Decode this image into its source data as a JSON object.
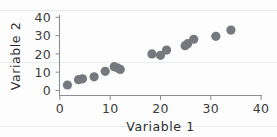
{
  "chart_data": {
    "type": "scatter",
    "title": "",
    "xlabel": "Variable 1",
    "ylabel": "Variable 2",
    "xlim": [
      0,
      40
    ],
    "ylim": [
      0,
      40
    ],
    "xticks": [
      0,
      10,
      20,
      30,
      40
    ],
    "yticks": [
      0,
      10,
      20,
      30,
      40
    ],
    "xtick_labels": [
      "0",
      "10",
      "20",
      "30",
      "40"
    ],
    "ytick_labels": [
      "0",
      "10",
      "20",
      "30",
      "40"
    ],
    "grid": false,
    "legend": null,
    "marker": {
      "shape": "circle",
      "color": "#75797d",
      "size": 4.6
    },
    "series": [
      {
        "name": "Variable 2 vs Variable 1",
        "points": [
          [
            1.5,
            3.0
          ],
          [
            3.7,
            5.9
          ],
          [
            4.5,
            6.4
          ],
          [
            6.8,
            7.5
          ],
          [
            9.0,
            10.5
          ],
          [
            10.8,
            13.0
          ],
          [
            11.4,
            12.4
          ],
          [
            12.0,
            11.5
          ],
          [
            18.3,
            20.0
          ],
          [
            20.0,
            19.2
          ],
          [
            21.2,
            22.1
          ],
          [
            24.9,
            24.5
          ],
          [
            25.4,
            25.6
          ],
          [
            26.6,
            28.0
          ],
          [
            31.0,
            29.6
          ],
          [
            34.0,
            33.0
          ]
        ]
      }
    ]
  },
  "labels": {
    "x_axis_title": "Variable 1",
    "y_axis_title": "Variable 2",
    "x0": "0",
    "x10": "10",
    "x20": "20",
    "x30": "30",
    "x40": "40",
    "y0": "0",
    "y10": "10",
    "y20": "20",
    "y30": "30",
    "y40": "40"
  }
}
